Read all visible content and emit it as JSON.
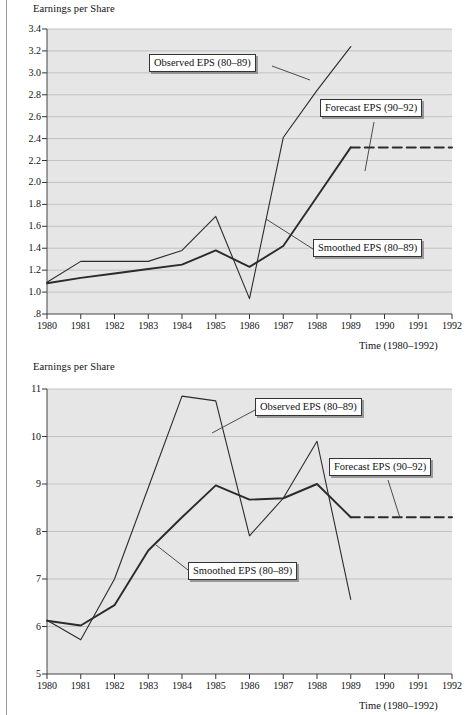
{
  "page": {
    "charts": [
      {
        "id": "top",
        "ylabel": "Earnings per Share",
        "xlabel": "Time (1980–1992)",
        "ytick_labels": [
          "3.4",
          "3.2",
          "3.0",
          "2.8",
          "2.6",
          "2.4",
          "2.2",
          "2.0",
          "1.8",
          "1.6",
          "1.4",
          "1.2",
          "1.0",
          ".8"
        ],
        "xtick_labels": [
          "1980",
          "1981",
          "1982",
          "1983",
          "1984",
          "1985",
          "1986",
          "1987",
          "1988",
          "1989",
          "1990",
          "1991",
          "1992"
        ],
        "callouts": [
          {
            "name": "observed",
            "text": "Observed EPS (80–89)"
          },
          {
            "name": "forecast",
            "text": "Forecast EPS (90–92)"
          },
          {
            "name": "smoothed",
            "text": "Smoothed EPS (80–89)"
          }
        ]
      },
      {
        "id": "bottom",
        "ylabel": "Earnings per Share",
        "xlabel": "Time (1980–1992)",
        "ytick_labels": [
          "11",
          "10",
          "9",
          "8",
          "7",
          "6",
          "5"
        ],
        "xtick_labels": [
          "1980",
          "1981",
          "1982",
          "1983",
          "1984",
          "1985",
          "1986",
          "1987",
          "1988",
          "1989",
          "1990",
          "1991",
          "1992"
        ],
        "callouts": [
          {
            "name": "observed",
            "text": "Observed EPS (80–89)"
          },
          {
            "name": "forecast",
            "text": "Forecast EPS (90–92)"
          },
          {
            "name": "smoothed",
            "text": "Smoothed EPS (80–89)"
          }
        ]
      }
    ]
  },
  "chart_data": [
    {
      "type": "line",
      "id": "top",
      "title": "",
      "ylabel": "Earnings per Share",
      "xlabel": "Time (1980–1992)",
      "x": [
        1980,
        1981,
        1982,
        1983,
        1984,
        1985,
        1986,
        1987,
        1988,
        1989,
        1990,
        1991,
        1992
      ],
      "xlim": [
        1980,
        1992
      ],
      "ylim": [
        0.8,
        3.4
      ],
      "yticks": [
        0.8,
        1.0,
        1.2,
        1.4,
        1.6,
        1.8,
        2.0,
        2.2,
        2.4,
        2.6,
        2.8,
        3.0,
        3.2,
        3.4
      ],
      "grid": true,
      "legend_position": "inline-callouts",
      "series": [
        {
          "name": "Observed EPS (80–89)",
          "style": "solid",
          "x": [
            1980,
            1981,
            1982,
            1983,
            1984,
            1985,
            1986,
            1987,
            1988,
            1989
          ],
          "values": [
            1.09,
            1.28,
            1.28,
            1.28,
            1.38,
            1.69,
            0.94,
            2.41,
            2.84,
            3.24
          ]
        },
        {
          "name": "Smoothed EPS (80–89)",
          "style": "solid-bold",
          "x": [
            1980,
            1981,
            1982,
            1983,
            1984,
            1985,
            1986,
            1987,
            1988,
            1989
          ],
          "values": [
            1.08,
            1.13,
            1.17,
            1.21,
            1.25,
            1.38,
            1.23,
            1.42,
            1.87,
            2.32
          ]
        },
        {
          "name": "Forecast EPS (90–92)",
          "style": "dashed",
          "x": [
            1989,
            1990,
            1991,
            1992
          ],
          "values": [
            2.32,
            2.32,
            2.32,
            2.32
          ]
        }
      ]
    },
    {
      "type": "line",
      "id": "bottom",
      "title": "",
      "ylabel": "Earnings per Share",
      "xlabel": "Time (1980–1992)",
      "x": [
        1980,
        1981,
        1982,
        1983,
        1984,
        1985,
        1986,
        1987,
        1988,
        1989,
        1990,
        1991,
        1992
      ],
      "xlim": [
        1980,
        1992
      ],
      "ylim": [
        5,
        11
      ],
      "yticks": [
        5,
        6,
        7,
        8,
        9,
        10,
        11
      ],
      "grid": true,
      "legend_position": "inline-callouts",
      "series": [
        {
          "name": "Observed EPS (80–89)",
          "style": "solid",
          "x": [
            1980,
            1981,
            1982,
            1983,
            1984,
            1985,
            1986,
            1987,
            1988,
            1989
          ],
          "values": [
            6.13,
            5.72,
            7.0,
            8.92,
            10.85,
            10.75,
            7.91,
            8.7,
            9.9,
            6.57
          ]
        },
        {
          "name": "Smoothed EPS (80–89)",
          "style": "solid-bold",
          "x": [
            1980,
            1981,
            1982,
            1983,
            1984,
            1985,
            1986,
            1987,
            1988,
            1989
          ],
          "values": [
            6.12,
            6.02,
            6.45,
            7.6,
            8.3,
            8.97,
            8.67,
            8.7,
            9.0,
            8.3
          ]
        },
        {
          "name": "Forecast EPS (90–92)",
          "style": "dashed",
          "x": [
            1989,
            1990,
            1991,
            1992
          ],
          "values": [
            8.3,
            8.3,
            8.3,
            8.3
          ]
        }
      ]
    }
  ]
}
